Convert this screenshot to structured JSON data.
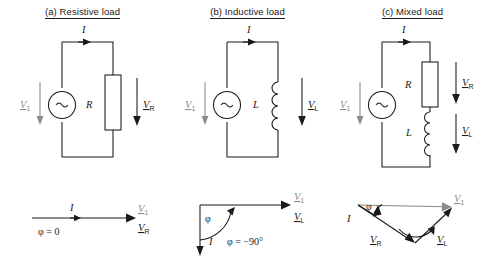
{
  "figure": {
    "colors": {
      "line": "#1a1a1a",
      "gray_line": "#8a8a8a",
      "background": "#ffffff"
    }
  },
  "panels": [
    {
      "id": "a",
      "title": "(a) Resistive load",
      "circuit": {
        "source_label": "V",
        "source_sub": "1",
        "source_symbol": "~",
        "current_label": "I",
        "component_label": "R",
        "component_type": "resistor",
        "component_voltage_label": "V",
        "component_voltage_sub": "R"
      },
      "phasor": {
        "type": "in-phase",
        "current_label": "I",
        "phase_text": "φ = 0",
        "tip_labels": [
          {
            "label": "V",
            "sub": "1"
          },
          {
            "label": "V",
            "sub": "R"
          }
        ]
      }
    },
    {
      "id": "b",
      "title": "(b) Inductive load",
      "circuit": {
        "source_label": "V",
        "source_sub": "1",
        "source_symbol": "~",
        "current_label": "I",
        "component_label": "L",
        "component_type": "inductor",
        "component_voltage_label": "V",
        "component_voltage_sub": "L"
      },
      "phasor": {
        "type": "lagging-90",
        "current_label": "I",
        "angle_label": "φ",
        "phase_text": "φ = −90°",
        "tip_labels": [
          {
            "label": "V",
            "sub": "1"
          },
          {
            "label": "V",
            "sub": "L"
          }
        ]
      }
    },
    {
      "id": "c",
      "title": "(c) Mixed load",
      "circuit": {
        "source_label": "V",
        "source_sub": "1",
        "source_symbol": "~",
        "current_label": "I",
        "component_label_r": "R",
        "component_label_l": "L",
        "component_voltage_r": {
          "label": "V",
          "sub": "R"
        },
        "component_voltage_l": {
          "label": "V",
          "sub": "L"
        }
      },
      "phasor": {
        "type": "triangle",
        "current_label": "I",
        "angle_label": "φ",
        "vectors": [
          {
            "label": "V",
            "sub": "1"
          },
          {
            "label": "V",
            "sub": "R"
          },
          {
            "label": "V",
            "sub": "L"
          }
        ]
      }
    }
  ]
}
